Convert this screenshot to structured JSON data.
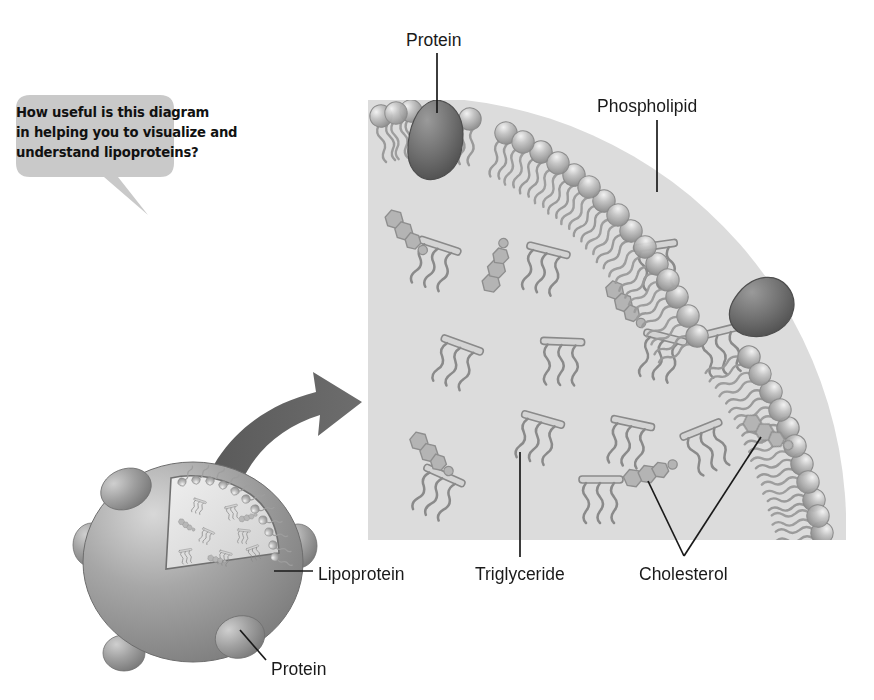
{
  "figure": {
    "kind": "biology-illustration",
    "background_color": "#ffffff"
  },
  "callout": {
    "name": "question-balloon",
    "shape": "rounded-rectangle-with-tail",
    "fill_color": "#c9c9c9",
    "text_color": "#111111",
    "lines": [
      "How useful is this diagram",
      "in helping you to visualize and",
      "understand lipoproteins?"
    ],
    "full_text": "How useful is this diagram in helping you to visualize and understand lipoproteins?"
  },
  "labels": {
    "protein_top": "Protein",
    "phospholipid": "Phospholipid",
    "lipoprotein": "Lipoprotein",
    "triglyceride": "Triglyceride",
    "cholesterol": "Cholesterol",
    "protein_bottom": "Protein"
  },
  "colors": {
    "panel_interior": "#dcdcdc",
    "phospholipid_head": "#a8a8a8",
    "phospholipid_tail": "#9a9a9a",
    "protein_dark": "#6e6e6e",
    "triglyceride_outline": "#8c8c8c",
    "cholesterol_fill": "#b0b0b0",
    "lipoprotein_body": "#9d9d9d",
    "arrow": "#5e5e5e",
    "leader_line": "#1a1a1a"
  },
  "components": {
    "magnified_panel": {
      "name": "magnified-lipoprotein-cross-section",
      "description": "Square grey panel showing a quarter-arc of phospholipid bilayer membrane with embedded proteins, and an interior core filled with triglycerides and cholesterol."
    },
    "phospholipid": {
      "description": "Spherical head with two wavy hydrocarbon tails; heads form the outer arc, tails point inward.",
      "count_in_arc": 17
    },
    "protein_embedded": {
      "description": "Large dark pear-shaped bodies embedded in the phospholipid arc.",
      "count": 2
    },
    "triglyceride": {
      "description": "Horizontal glycerol bar with three wavy fatty-acid tails hanging from it.",
      "count": 12
    },
    "cholesterol": {
      "description": "Small cluster of fused hexagonal rings with a short tail.",
      "count": 5
    },
    "lipoprotein_sphere": {
      "description": "Shaded sphere with surface protein bumps and a cut-away wedge revealing the lipid core.",
      "surface_protein_bumps": 5
    },
    "arrow": {
      "description": "Thick curved arrow leading from the sphere cut-away to the magnified panel."
    }
  },
  "leader_lines": [
    {
      "label": "protein_top",
      "from": [
        437,
        52
      ],
      "to": [
        437,
        110
      ]
    },
    {
      "label": "phospholipid",
      "from": [
        657,
        120
      ],
      "to": [
        657,
        190
      ]
    },
    {
      "label": "lipoprotein",
      "from": [
        313,
        571
      ],
      "to": [
        275,
        571
      ]
    },
    {
      "label": "triglyceride",
      "from": [
        520,
        558
      ],
      "to": [
        520,
        452
      ]
    },
    {
      "label": "cholesterol",
      "from": [
        683,
        556
      ],
      "to": [
        647,
        480
      ]
    },
    {
      "label": "cholesterol",
      "from": [
        683,
        556
      ],
      "to": [
        762,
        440
      ]
    },
    {
      "label": "protein_bottom",
      "from": [
        266,
        661
      ],
      "to": [
        240,
        629
      ]
    }
  ]
}
